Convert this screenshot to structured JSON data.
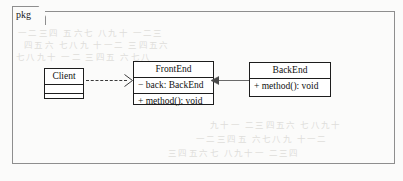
{
  "diagram": {
    "kind": "uml-package-diagram",
    "package": {
      "tab_label": "pkg"
    },
    "classes": [
      {
        "id": "client",
        "name": "Client",
        "attributes": [],
        "operations": [],
        "compartments": 3
      },
      {
        "id": "frontend",
        "name": "FrontEnd",
        "attributes": [
          "− back: BackEnd"
        ],
        "operations": [
          "+ method(): void"
        ],
        "compartments": 3
      },
      {
        "id": "backend",
        "name": "BackEnd",
        "attributes": [],
        "operations": [
          "+ method(): void"
        ],
        "compartments": 2
      }
    ],
    "relationships": [
      {
        "id": "dependency",
        "type": "dependency",
        "style": "dashed",
        "arrowhead": "open",
        "from": "Client",
        "to": "FrontEnd"
      },
      {
        "id": "association",
        "type": "association",
        "style": "solid",
        "arrowhead": "filled",
        "from": "BackEnd",
        "to": "FrontEnd"
      }
    ]
  },
  "colors": {
    "page_background": "#fbfbfa",
    "frame_stroke": "#8e8e8e",
    "class_stroke": "#1d1d1d",
    "class_fill": "#ffffff",
    "text": "#111111",
    "dependency_stroke": "#3a3a3a",
    "association_stroke": "#6a6a6a",
    "bleed_through": "#dfdedb"
  },
  "background_bleed": {
    "lines": [
      "一二三四 五六七 八九十 一二三",
      "四五六 七八九 十一二 三四五六",
      "七八九十 一二 三四五 六七八",
      "九十一 二三四五六 七八九十",
      "一二三四五 六七八九 十一二",
      "三四五六七 八九十一 二三四"
    ]
  }
}
